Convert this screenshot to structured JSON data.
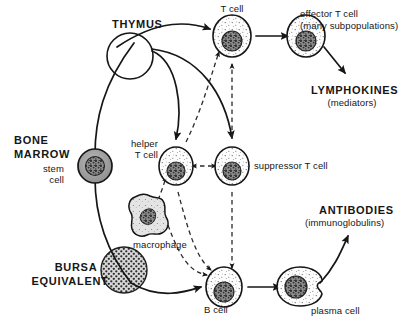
{
  "diagram": {
    "colors": {
      "ink": "#161616",
      "stroke": "#1a1a1a",
      "cell_fill": "#fbfbfb",
      "nucleus": "#4a4a4a",
      "stem_cell_fill": "#9a9a9a",
      "bursa_fill": "#8d8d8d",
      "macrophage_fill": "#dedede",
      "background": "#ffffff"
    },
    "organs": [
      {
        "id": "thymus",
        "label": "THYMUS",
        "shape": "open-circle"
      },
      {
        "id": "bone-marrow",
        "label": "BONE\nMARROW",
        "shape": "text-only"
      },
      {
        "id": "bursa-equivalent",
        "label": "BURSA\nEQUIVALENT",
        "shape": "stippled-circle"
      }
    ],
    "cells": [
      {
        "id": "stem-cell",
        "label": "stem\ncell",
        "type": "shaded-round-cell"
      },
      {
        "id": "t-cell",
        "label": "T cell",
        "type": "stippled-round-cell"
      },
      {
        "id": "helper-t-cell",
        "label": "helper\nT cell",
        "type": "stippled-round-cell"
      },
      {
        "id": "suppressor-t-cell",
        "label": "suppressor T cell",
        "type": "stippled-round-cell"
      },
      {
        "id": "effector-t-cell",
        "label": "effector T cell\n(many subpopulations)",
        "type": "stippled-round-cell"
      },
      {
        "id": "macrophage",
        "label": "macrophage",
        "type": "amoeboid-cell"
      },
      {
        "id": "b-cell",
        "label": "B cell",
        "type": "stippled-round-cell"
      },
      {
        "id": "plasma-cell",
        "label": "plasma cell",
        "type": "notched-oval-cell"
      }
    ],
    "products": [
      {
        "id": "lymphokines",
        "name": "LYMPHOKINES",
        "qualifier": "(mediators)"
      },
      {
        "id": "antibodies",
        "name": "ANTIBODIES",
        "qualifier": "(immunoglobulins)"
      }
    ],
    "labels": {
      "thymus": "THYMUS",
      "bone_marrow_line1": "BONE",
      "bone_marrow_line2": "MARROW",
      "stem_cell_line1": "stem",
      "stem_cell_line2": "cell",
      "bursa_line1": "BURSA",
      "bursa_line2": "EQUIVALENT",
      "t_cell": "T cell",
      "helper_t_cell_line1": "helper",
      "helper_t_cell_line2": "T cell",
      "suppressor_t_cell": "suppressor T cell",
      "effector_t_cell_line1": "effector T cell",
      "effector_t_cell_line2": "(many subpopulations)",
      "lymphokines_line1": "LYMPHOKINES",
      "lymphokines_line2": "(mediators)",
      "macrophage": "macrophage",
      "b_cell": "B cell",
      "plasma_cell": "plasma cell",
      "antibodies_line1": "ANTIBODIES",
      "antibodies_line2": "(immunoglobulins)"
    },
    "connections": [
      {
        "id": "stem-to-thymus",
        "from": "stem-cell",
        "to": "thymus",
        "style": "solid-curve"
      },
      {
        "id": "stem-to-bursa",
        "from": "stem-cell",
        "to": "bursa-equivalent",
        "style": "solid-curve"
      },
      {
        "id": "thymus-to-t-cell",
        "from": "thymus",
        "to": "t-cell",
        "style": "solid-curve-arrow"
      },
      {
        "id": "thymus-to-helper",
        "from": "thymus",
        "to": "helper-t-cell",
        "style": "solid-curve-arrow"
      },
      {
        "id": "thymus-to-suppressor",
        "from": "thymus",
        "to": "suppressor-t-cell",
        "style": "solid-curve-arrow"
      },
      {
        "id": "t-cell-to-effector",
        "from": "t-cell",
        "to": "effector-t-cell",
        "style": "solid-arrow"
      },
      {
        "id": "effector-to-lymphokines",
        "from": "effector-t-cell",
        "to": "lymphokines",
        "style": "solid-arrow"
      },
      {
        "id": "helper-to-t-cell",
        "from": "helper-t-cell",
        "to": "t-cell",
        "style": "dashed-arrow"
      },
      {
        "id": "helper-to-suppressor",
        "from": "helper-t-cell",
        "to": "suppressor-t-cell",
        "style": "dashed-double-arrow"
      },
      {
        "id": "suppressor-to-t-cell",
        "from": "suppressor-t-cell",
        "to": "t-cell",
        "style": "dashed-arrow"
      },
      {
        "id": "suppressor-to-b-cell",
        "from": "suppressor-t-cell",
        "to": "b-cell",
        "style": "dashed-arrow"
      },
      {
        "id": "macrophage-to-helper",
        "from": "macrophage",
        "to": "helper-t-cell",
        "style": "dashed-arrow"
      },
      {
        "id": "macrophage-to-b-cell",
        "from": "macrophage",
        "to": "b-cell",
        "style": "dashed-curve-arrow"
      },
      {
        "id": "helper-to-b-cell",
        "from": "helper-t-cell",
        "to": "b-cell",
        "style": "dashed-curve-arrow"
      },
      {
        "id": "bursa-to-b-cell",
        "from": "bursa-equivalent",
        "to": "b-cell",
        "style": "solid-curve-arrow"
      },
      {
        "id": "b-cell-to-plasma",
        "from": "b-cell",
        "to": "plasma-cell",
        "style": "solid-arrow"
      },
      {
        "id": "plasma-to-antibodies",
        "from": "plasma-cell",
        "to": "antibodies",
        "style": "solid-curve-arrow"
      }
    ]
  }
}
